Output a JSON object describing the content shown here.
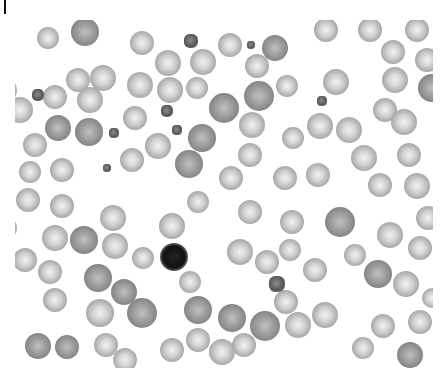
{
  "image": {
    "description": "Grayscale microscopy blood smear showing red blood cells, platelets and a single lymphocyte",
    "width": 444,
    "height": 378
  },
  "cells": [
    {
      "type": "rbc",
      "x": 0,
      "y": 30,
      "r": 15
    },
    {
      "type": "rbc",
      "x": 48,
      "y": 38,
      "r": 11
    },
    {
      "type": "rbc dark",
      "x": 85,
      "y": 32,
      "r": 14
    },
    {
      "type": "rbc",
      "x": 142,
      "y": 43,
      "r": 12
    },
    {
      "type": "rbc",
      "x": 230,
      "y": 45,
      "r": 12
    },
    {
      "type": "rbc dark",
      "x": 275,
      "y": 48,
      "r": 13
    },
    {
      "type": "rbc",
      "x": 326,
      "y": 30,
      "r": 12
    },
    {
      "type": "rbc",
      "x": 370,
      "y": 30,
      "r": 12
    },
    {
      "type": "rbc",
      "x": 417,
      "y": 30,
      "r": 12
    },
    {
      "type": "rbc",
      "x": 78,
      "y": 80,
      "r": 12
    },
    {
      "type": "rbc",
      "x": 55,
      "y": 97,
      "r": 12
    },
    {
      "type": "rbc",
      "x": 103,
      "y": 78,
      "r": 13
    },
    {
      "type": "rbc",
      "x": 168,
      "y": 63,
      "r": 13
    },
    {
      "type": "rbc",
      "x": 203,
      "y": 62,
      "r": 13
    },
    {
      "type": "rbc",
      "x": 257,
      "y": 66,
      "r": 12
    },
    {
      "type": "rbc",
      "x": 393,
      "y": 52,
      "r": 12
    },
    {
      "type": "rbc",
      "x": 427,
      "y": 60,
      "r": 12
    },
    {
      "type": "rbc",
      "x": 5,
      "y": 90,
      "r": 12
    },
    {
      "type": "rbc",
      "x": 20,
      "y": 110,
      "r": 13
    },
    {
      "type": "rbc",
      "x": 90,
      "y": 100,
      "r": 13
    },
    {
      "type": "rbc",
      "x": 140,
      "y": 85,
      "r": 13
    },
    {
      "type": "rbc",
      "x": 170,
      "y": 90,
      "r": 13
    },
    {
      "type": "rbc",
      "x": 197,
      "y": 88,
      "r": 11
    },
    {
      "type": "rbc dark",
      "x": 224,
      "y": 108,
      "r": 15
    },
    {
      "type": "rbc dark",
      "x": 259,
      "y": 96,
      "r": 15
    },
    {
      "type": "rbc",
      "x": 287,
      "y": 86,
      "r": 11
    },
    {
      "type": "rbc",
      "x": 336,
      "y": 82,
      "r": 13
    },
    {
      "type": "rbc",
      "x": 395,
      "y": 80,
      "r": 13
    },
    {
      "type": "rbc dark",
      "x": 432,
      "y": 88,
      "r": 14
    },
    {
      "type": "rbc",
      "x": 135,
      "y": 118,
      "r": 12
    },
    {
      "type": "rbc dark",
      "x": 202,
      "y": 138,
      "r": 14
    },
    {
      "type": "rbc",
      "x": 252,
      "y": 125,
      "r": 13
    },
    {
      "type": "rbc",
      "x": 293,
      "y": 138,
      "r": 11
    },
    {
      "type": "rbc",
      "x": 320,
      "y": 126,
      "r": 13
    },
    {
      "type": "rbc",
      "x": 349,
      "y": 130,
      "r": 13
    },
    {
      "type": "rbc",
      "x": 385,
      "y": 110,
      "r": 12
    },
    {
      "type": "rbc",
      "x": 404,
      "y": 122,
      "r": 13
    },
    {
      "type": "rbc dark",
      "x": 58,
      "y": 128,
      "r": 13
    },
    {
      "type": "rbc dark",
      "x": 89,
      "y": 132,
      "r": 14
    },
    {
      "type": "rbc",
      "x": 35,
      "y": 145,
      "r": 12
    },
    {
      "type": "rbc",
      "x": 62,
      "y": 170,
      "r": 12
    },
    {
      "type": "rbc",
      "x": 30,
      "y": 172,
      "r": 11
    },
    {
      "type": "rbc",
      "x": 132,
      "y": 160,
      "r": 12
    },
    {
      "type": "rbc",
      "x": 158,
      "y": 146,
      "r": 13
    },
    {
      "type": "rbc dark",
      "x": 189,
      "y": 164,
      "r": 14
    },
    {
      "type": "rbc",
      "x": 231,
      "y": 178,
      "r": 12
    },
    {
      "type": "rbc",
      "x": 250,
      "y": 155,
      "r": 12
    },
    {
      "type": "rbc",
      "x": 285,
      "y": 178,
      "r": 12
    },
    {
      "type": "rbc",
      "x": 318,
      "y": 175,
      "r": 12
    },
    {
      "type": "rbc",
      "x": 364,
      "y": 158,
      "r": 13
    },
    {
      "type": "rbc",
      "x": 380,
      "y": 185,
      "r": 12
    },
    {
      "type": "rbc",
      "x": 409,
      "y": 155,
      "r": 12
    },
    {
      "type": "rbc",
      "x": 417,
      "y": 186,
      "r": 13
    },
    {
      "type": "rbc",
      "x": 28,
      "y": 200,
      "r": 12
    },
    {
      "type": "rbc",
      "x": 62,
      "y": 206,
      "r": 12
    },
    {
      "type": "rbc",
      "x": 113,
      "y": 218,
      "r": 13
    },
    {
      "type": "rbc",
      "x": 198,
      "y": 202,
      "r": 11
    },
    {
      "type": "rbc",
      "x": 250,
      "y": 212,
      "r": 12
    },
    {
      "type": "rbc",
      "x": 292,
      "y": 222,
      "r": 12
    },
    {
      "type": "rbc dark",
      "x": 340,
      "y": 222,
      "r": 15
    },
    {
      "type": "rbc",
      "x": 390,
      "y": 235,
      "r": 13
    },
    {
      "type": "rbc",
      "x": 428,
      "y": 218,
      "r": 12
    },
    {
      "type": "rbc",
      "x": 5,
      "y": 228,
      "r": 12
    },
    {
      "type": "rbc",
      "x": 55,
      "y": 238,
      "r": 13
    },
    {
      "type": "rbc dark",
      "x": 84,
      "y": 240,
      "r": 14
    },
    {
      "type": "rbc",
      "x": 115,
      "y": 246,
      "r": 13
    },
    {
      "type": "rbc",
      "x": 172,
      "y": 226,
      "r": 13
    },
    {
      "type": "rbc",
      "x": 240,
      "y": 252,
      "r": 13
    },
    {
      "type": "rbc",
      "x": 267,
      "y": 262,
      "r": 12
    },
    {
      "type": "rbc",
      "x": 290,
      "y": 250,
      "r": 11
    },
    {
      "type": "rbc",
      "x": 355,
      "y": 255,
      "r": 11
    },
    {
      "type": "rbc",
      "x": 420,
      "y": 248,
      "r": 12
    },
    {
      "type": "rbc",
      "x": 25,
      "y": 260,
      "r": 12
    },
    {
      "type": "rbc",
      "x": 50,
      "y": 272,
      "r": 12
    },
    {
      "type": "rbc",
      "x": 143,
      "y": 258,
      "r": 11
    },
    {
      "type": "rbc",
      "x": 315,
      "y": 270,
      "r": 12
    },
    {
      "type": "rbc dark",
      "x": 378,
      "y": 274,
      "r": 14
    },
    {
      "type": "rbc",
      "x": 406,
      "y": 284,
      "r": 13
    },
    {
      "type": "rbc dark",
      "x": 98,
      "y": 278,
      "r": 14
    },
    {
      "type": "rbc dark",
      "x": 124,
      "y": 292,
      "r": 13
    },
    {
      "type": "rbc",
      "x": 190,
      "y": 282,
      "r": 11
    },
    {
      "type": "rbc",
      "x": 286,
      "y": 302,
      "r": 12
    },
    {
      "type": "rbc",
      "x": 432,
      "y": 298,
      "r": 10
    },
    {
      "type": "rbc",
      "x": 55,
      "y": 300,
      "r": 12
    },
    {
      "type": "rbc",
      "x": 100,
      "y": 313,
      "r": 14
    },
    {
      "type": "rbc dark",
      "x": 142,
      "y": 313,
      "r": 15
    },
    {
      "type": "rbc dark",
      "x": 198,
      "y": 310,
      "r": 14
    },
    {
      "type": "rbc dark",
      "x": 232,
      "y": 318,
      "r": 14
    },
    {
      "type": "rbc dark",
      "x": 265,
      "y": 326,
      "r": 15
    },
    {
      "type": "rbc",
      "x": 298,
      "y": 325,
      "r": 13
    },
    {
      "type": "rbc",
      "x": 325,
      "y": 315,
      "r": 13
    },
    {
      "type": "rbc",
      "x": 383,
      "y": 326,
      "r": 12
    },
    {
      "type": "rbc",
      "x": 420,
      "y": 322,
      "r": 12
    },
    {
      "type": "rbc dark",
      "x": 38,
      "y": 346,
      "r": 13
    },
    {
      "type": "rbc dark",
      "x": 67,
      "y": 347,
      "r": 12
    },
    {
      "type": "rbc",
      "x": 106,
      "y": 345,
      "r": 12
    },
    {
      "type": "rbc",
      "x": 172,
      "y": 350,
      "r": 12
    },
    {
      "type": "rbc",
      "x": 198,
      "y": 340,
      "r": 12
    },
    {
      "type": "rbc",
      "x": 222,
      "y": 352,
      "r": 13
    },
    {
      "type": "rbc",
      "x": 244,
      "y": 345,
      "r": 12
    },
    {
      "type": "rbc",
      "x": 363,
      "y": 348,
      "r": 11
    },
    {
      "type": "rbc dark",
      "x": 410,
      "y": 355,
      "r": 13
    },
    {
      "type": "rbc",
      "x": 125,
      "y": 360,
      "r": 12
    },
    {
      "type": "plt",
      "x": 191,
      "y": 41,
      "r": 7
    },
    {
      "type": "plt",
      "x": 251,
      "y": 45,
      "r": 4
    },
    {
      "type": "plt",
      "x": 38,
      "y": 95,
      "r": 6
    },
    {
      "type": "plt",
      "x": 167,
      "y": 111,
      "r": 6
    },
    {
      "type": "plt",
      "x": 322,
      "y": 101,
      "r": 5
    },
    {
      "type": "plt",
      "x": 114,
      "y": 133,
      "r": 5
    },
    {
      "type": "plt",
      "x": 177,
      "y": 130,
      "r": 5
    },
    {
      "type": "plt",
      "x": 107,
      "y": 168,
      "r": 4
    },
    {
      "type": "plt",
      "x": 277,
      "y": 284,
      "r": 8
    },
    {
      "type": "lymph",
      "x": 174,
      "y": 257,
      "r": 14
    }
  ]
}
